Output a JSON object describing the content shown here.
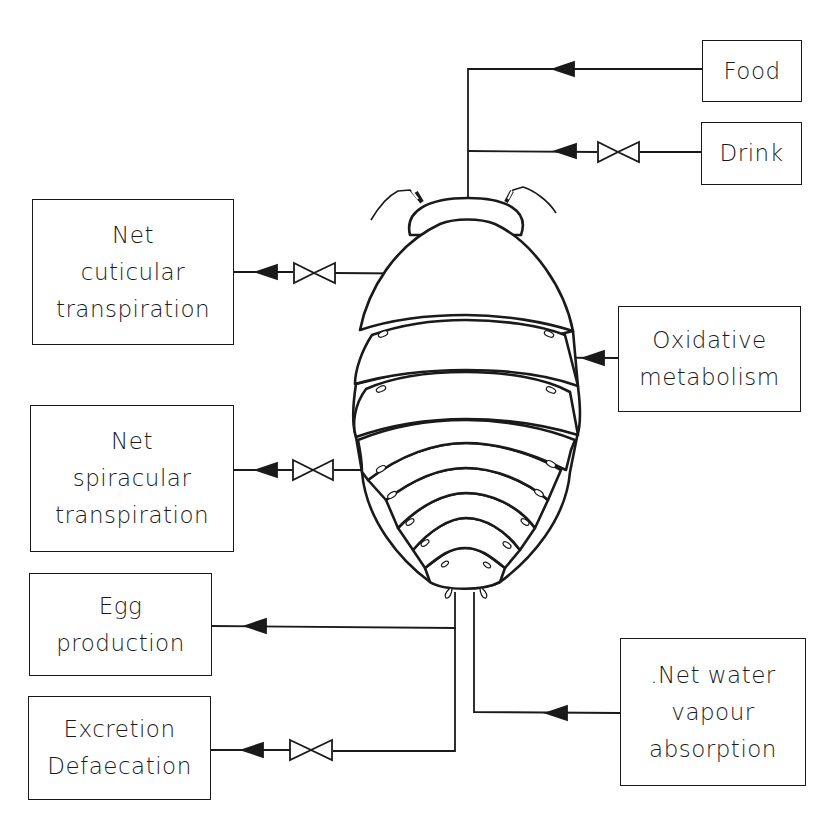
{
  "diagram": {
    "inputs": [
      {
        "id": "food",
        "lines": [
          "Food"
        ],
        "valve": false
      },
      {
        "id": "drink",
        "lines": [
          "Drink"
        ],
        "valve": true
      },
      {
        "id": "oxidative",
        "lines": [
          "Oxidative",
          "metabolism"
        ],
        "valve": false
      },
      {
        "id": "vapour",
        "lines": [
          ".Net  water",
          "vapour",
          "absorption"
        ],
        "valve": false
      }
    ],
    "outputs": [
      {
        "id": "cuticular",
        "lines": [
          "Net",
          "cuticular",
          "transpiration"
        ],
        "valve": true
      },
      {
        "id": "spiracular",
        "lines": [
          "Net",
          "spiracular",
          "transpiration"
        ],
        "valve": true
      },
      {
        "id": "egg",
        "lines": [
          "Egg",
          "production"
        ],
        "valve": false
      },
      {
        "id": "excretion",
        "lines": [
          "Excretion",
          "Defaecation"
        ],
        "valve": true
      }
    ],
    "central_figure": "woodlouse-body",
    "colors": {
      "ink": "#1a1a1a",
      "background": "#ffffff"
    }
  }
}
